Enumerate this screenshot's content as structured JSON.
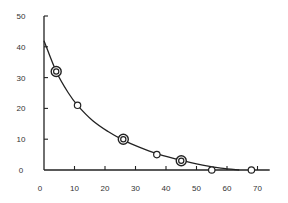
{
  "chart_data": {
    "type": "scatter",
    "title": "",
    "xlabel": "",
    "ylabel": "",
    "xlim": [
      0,
      70
    ],
    "ylim": [
      0,
      50
    ],
    "x_ticks": [
      0,
      10,
      20,
      30,
      40,
      50,
      60,
      70
    ],
    "y_ticks": [
      0,
      10,
      20,
      30,
      40,
      50
    ],
    "grid": false,
    "legend": null,
    "series": [
      {
        "name": "observations",
        "points": [
          {
            "x": 4,
            "y": 32,
            "marker": "double-circle"
          },
          {
            "x": 11,
            "y": 21,
            "marker": "circle"
          },
          {
            "x": 26,
            "y": 10,
            "marker": "double-circle"
          },
          {
            "x": 37,
            "y": 5,
            "marker": "circle"
          },
          {
            "x": 45,
            "y": 3,
            "marker": "double-circle"
          },
          {
            "x": 55,
            "y": 0,
            "marker": "circle"
          },
          {
            "x": 68,
            "y": 0,
            "marker": "circle"
          }
        ]
      },
      {
        "name": "fitted-curve",
        "type": "line",
        "points": [
          {
            "x": 0,
            "y": 42
          },
          {
            "x": 4,
            "y": 32
          },
          {
            "x": 8,
            "y": 25
          },
          {
            "x": 11,
            "y": 21
          },
          {
            "x": 16,
            "y": 16
          },
          {
            "x": 21,
            "y": 12.5
          },
          {
            "x": 26,
            "y": 9.7
          },
          {
            "x": 31,
            "y": 7.5
          },
          {
            "x": 37,
            "y": 5.3
          },
          {
            "x": 45,
            "y": 3.1
          },
          {
            "x": 52,
            "y": 1.6
          },
          {
            "x": 58,
            "y": 0.6
          },
          {
            "x": 64,
            "y": 0
          }
        ]
      }
    ]
  },
  "axes": {
    "x_labels": [
      "0",
      "10",
      "20",
      "30",
      "40",
      "50",
      "60",
      "70"
    ],
    "y_labels": [
      "0",
      "10",
      "20",
      "30",
      "40",
      "50"
    ]
  }
}
